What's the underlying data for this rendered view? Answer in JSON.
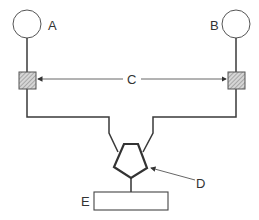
{
  "diagram": {
    "labels": {
      "a": "A",
      "b": "B",
      "c": "C",
      "d": "D",
      "e": "E"
    },
    "colors": {
      "stroke": "#3a3a3a",
      "thin_stroke": "#555555",
      "hatch_fill": "#bbbbbb",
      "background": "#ffffff"
    },
    "components": [
      {
        "id": "A",
        "shape": "circle"
      },
      {
        "id": "B",
        "shape": "circle"
      },
      {
        "id": "C",
        "shape": "double-arrow pointing to hatched squares"
      },
      {
        "id": "D",
        "shape": "pentagon"
      },
      {
        "id": "E",
        "shape": "rectangle"
      }
    ]
  }
}
